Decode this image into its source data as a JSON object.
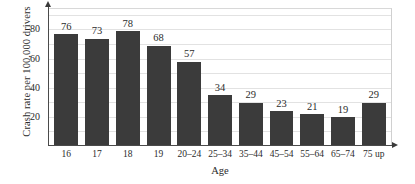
{
  "chart_data": {
    "type": "bar",
    "title": "",
    "xlabel": "Age",
    "ylabel": "Crash rate per 100,000 drivers",
    "categories": [
      "16",
      "17",
      "18",
      "19",
      "20–24",
      "25–34",
      "35–44",
      "45–54",
      "55–64",
      "65–74",
      "75 up"
    ],
    "values": [
      76,
      73,
      78,
      68,
      57,
      34,
      29,
      23,
      21,
      19,
      29
    ],
    "value_labels": [
      "76",
      "73",
      "78",
      "68",
      "57",
      "34",
      "29",
      "23",
      "21",
      "19",
      "29"
    ],
    "ylim": [
      0,
      94
    ],
    "yticks": [
      20,
      40,
      60,
      80
    ],
    "ytick_labels": [
      "20",
      "40",
      "60",
      "80"
    ],
    "gridlines": [
      10,
      20,
      30,
      40,
      50,
      60,
      70,
      80,
      90
    ],
    "grid": true,
    "legend": "none",
    "bar_color": "#3b3b3b",
    "grid_color": "#e2e2e2",
    "axis_color": "#4a4a4a",
    "background": "#ffffff"
  }
}
